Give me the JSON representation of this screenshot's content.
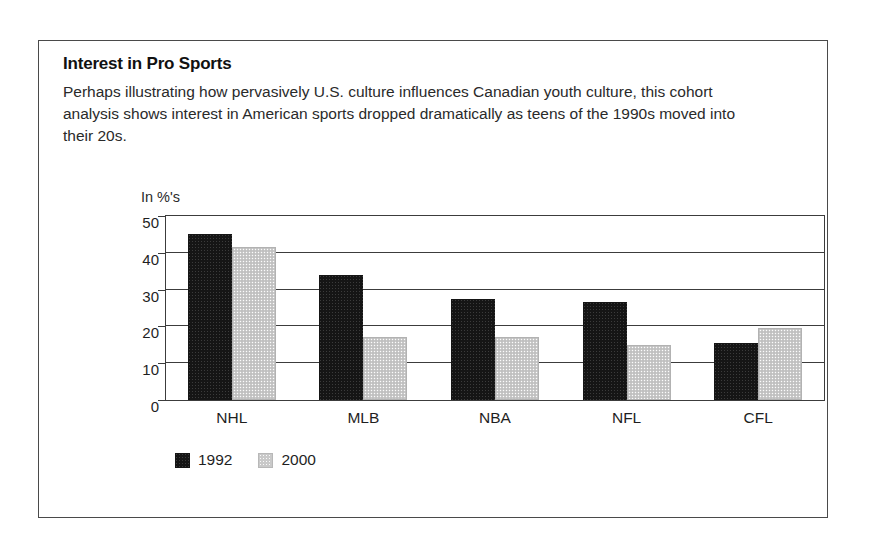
{
  "figure": {
    "title": "Interest in Pro Sports",
    "description": "Perhaps illustrating how pervasively U.S. culture influences Canadian youth culture, this cohort analysis shows interest in American sports dropped dramatically as teens of the 1990s moved into their 20s.",
    "border_color": "#4a4a4a"
  },
  "chart_data": {
    "type": "bar",
    "title": "Interest in Pro Sports",
    "subtitle": "Perhaps illustrating how pervasively U.S. culture influences Canadian youth culture, this cohort analysis shows interest in American sports dropped dramatically as teens of the 1990s moved into their 20s.",
    "xlabel": "",
    "ylabel": "In %'s",
    "ylim": [
      0,
      50
    ],
    "ytick_values": [
      0,
      10,
      20,
      30,
      40,
      50
    ],
    "ytick_labels": [
      "0",
      "10",
      "20",
      "30",
      "40",
      "50"
    ],
    "grid": true,
    "grid_axis": "y",
    "legend_position": "bottom-left",
    "categories": [
      "NHL",
      "MLB",
      "NBA",
      "NFL",
      "CFL"
    ],
    "series": [
      {
        "name": "1992",
        "color": "#151515",
        "values": [
          45,
          34,
          27.5,
          26.5,
          15.5
        ]
      },
      {
        "name": "2000",
        "color": "#c9c9c9",
        "values": [
          41.5,
          17,
          17,
          15,
          19.5
        ]
      }
    ]
  }
}
